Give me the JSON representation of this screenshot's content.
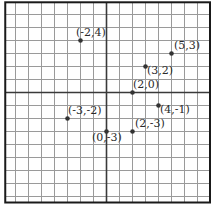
{
  "diagram": {
    "type": "coordinate-plane",
    "grid": {
      "unit_px": 13,
      "origin_px": [
        106,
        92
      ],
      "x_range": [
        -7.75,
        8
      ],
      "y_range": [
        -8.5,
        6.9
      ],
      "grid_color": "#9a9a9a",
      "axis_color": "#3a3a3a",
      "border_color": "#1a1a1a"
    },
    "points": [
      {
        "x": -2,
        "y": 4,
        "label": "(-2,4)",
        "label_dx": -4,
        "label_dy": -4
      },
      {
        "x": 5,
        "y": 3,
        "label": "(5,3)",
        "label_dx": 3,
        "label_dy": -4
      },
      {
        "x": 3,
        "y": 2,
        "label": "(3,2)",
        "label_dx": 2,
        "label_dy": 8
      },
      {
        "x": 2,
        "y": 0,
        "label": "(2,0)",
        "label_dx": 1,
        "label_dy": -4
      },
      {
        "x": 4,
        "y": -1,
        "label": "(4,-1)",
        "label_dx": 2,
        "label_dy": 8
      },
      {
        "x": -3,
        "y": -2,
        "label": "(-3,-2)",
        "label_dx": 1,
        "label_dy": -4
      },
      {
        "x": 0,
        "y": -3,
        "label": "(0,-3)",
        "label_dx": -14,
        "label_dy": 10
      },
      {
        "x": 2,
        "y": -3,
        "label": "(2,-3)",
        "label_dx": 3,
        "label_dy": -4
      }
    ],
    "point_color": "#333333"
  }
}
